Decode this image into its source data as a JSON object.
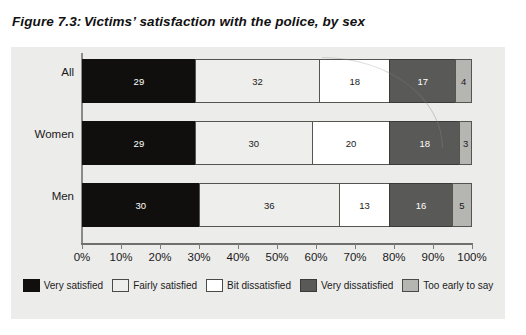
{
  "figure": {
    "number": "Figure 7.3:",
    "title": "Victims’ satisfaction with the police, by sex"
  },
  "chart_data": {
    "type": "bar",
    "orientation": "horizontal",
    "stacked": true,
    "normalized_percent": true,
    "title": "Victims’ satisfaction with the police, by sex",
    "xlabel": "",
    "ylabel": "",
    "xlim": [
      0,
      100
    ],
    "grid": false,
    "legend_position": "bottom",
    "categories": [
      "All",
      "Women",
      "Men"
    ],
    "tick_labels": [
      "0%",
      "10%",
      "20%",
      "30%",
      "40%",
      "50%",
      "60%",
      "70%",
      "80%",
      "90%",
      "100%"
    ],
    "tick_values": [
      0,
      10,
      20,
      30,
      40,
      50,
      60,
      70,
      80,
      90,
      100
    ],
    "series": [
      {
        "name": "Very satisfied",
        "color": "#100f0d",
        "values": [
          29,
          29,
          30
        ]
      },
      {
        "name": "Fairly satisfied",
        "color": "#eeeeec",
        "values": [
          32,
          30,
          36
        ]
      },
      {
        "name": "Bit dissatisfied",
        "color": "#ffffff",
        "values": [
          18,
          20,
          13
        ]
      },
      {
        "name": "Very dissatisfied",
        "color": "#595957",
        "values": [
          17,
          18,
          16
        ]
      },
      {
        "name": "Too early to say",
        "color": "#b5b5b1",
        "values": [
          4,
          3,
          5
        ]
      }
    ]
  }
}
